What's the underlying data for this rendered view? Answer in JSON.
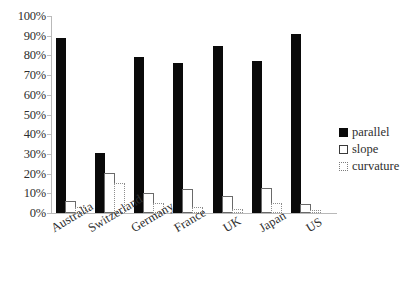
{
  "chart_data": {
    "type": "bar",
    "title": "",
    "subtitle": "",
    "xlabel": "",
    "ylabel": "",
    "ylim": [
      0,
      100
    ],
    "ytick_labels": [
      "100%",
      "90%",
      "80%",
      "70%",
      "60%",
      "50%",
      "40%",
      "30%",
      "20%",
      "10%",
      "0%"
    ],
    "ytick_values": [
      100,
      90,
      80,
      70,
      60,
      50,
      40,
      30,
      20,
      10,
      0
    ],
    "grid": false,
    "legend_position": "right",
    "categories": [
      "Australia",
      "Switzerland",
      "Germany",
      "France",
      "UK",
      "Japan",
      "US"
    ],
    "series": [
      {
        "name": "parallel",
        "values": [
          89,
          30.5,
          79,
          76,
          85,
          77,
          91
        ]
      },
      {
        "name": "slope",
        "values": [
          6,
          20.5,
          10,
          12,
          8.5,
          12.5,
          4.5
        ]
      },
      {
        "name": "curvature",
        "values": [
          3,
          15,
          5,
          3,
          2,
          5,
          1.5
        ]
      }
    ],
    "series_styles": [
      {
        "name": "parallel",
        "fill": "#0a0a0a",
        "border": "#0a0a0a",
        "border_style": "solid"
      },
      {
        "name": "slope",
        "fill": "#ffffff",
        "border": "#6a6a6a",
        "border_style": "solid"
      },
      {
        "name": "curvature",
        "fill": "#ffffff",
        "border": "#8d8d8d",
        "border_style": "dotted"
      }
    ]
  },
  "legend": {
    "items": [
      {
        "label": "parallel",
        "swatch": "filled-black-square"
      },
      {
        "label": "slope",
        "swatch": "outlined-white-square"
      },
      {
        "label": "curvature",
        "swatch": "dotted-outline-square"
      }
    ]
  },
  "axes": {
    "y_axis_color": "#b9b9b9",
    "x_axis_color": "#b9b9b9"
  }
}
